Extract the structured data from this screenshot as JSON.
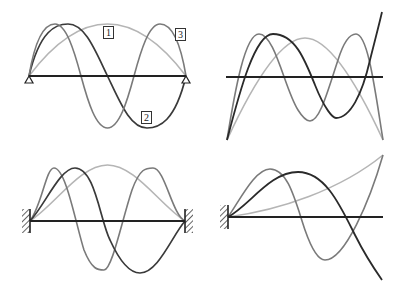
{
  "colors": {
    "mode1": "#b5b5b5",
    "mode2": "#2a2a2a",
    "mode3": "#7a7a7a",
    "beam": "#222222"
  },
  "panels": [
    {
      "id": "simply-supported",
      "description": "Pinned-pinned beam",
      "labels": [
        "1",
        "2",
        "3"
      ]
    },
    {
      "id": "free-free",
      "description": "Free-free beam"
    },
    {
      "id": "fixed-fixed",
      "description": "Clamped-clamped beam"
    },
    {
      "id": "cantilever",
      "description": "Clamped-free beam"
    }
  ]
}
